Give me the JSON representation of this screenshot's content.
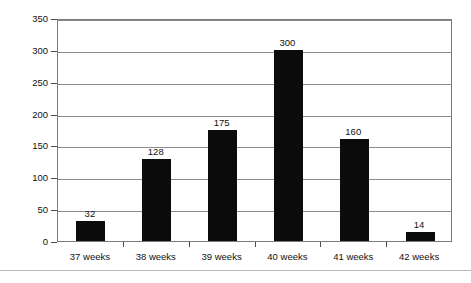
{
  "chart_data": {
    "type": "bar",
    "title": "",
    "subtitle": "",
    "xlabel": "",
    "ylabel": "Number of newborns",
    "categories": [
      "37 weeks",
      "38 weeks",
      "39 weeks",
      "40 weeks",
      "41 weeks",
      "42 weeks"
    ],
    "values": [
      32,
      128,
      175,
      300,
      160,
      14
    ],
    "data_labels": [
      "32",
      "128",
      "175",
      "300",
      "160",
      "14"
    ],
    "ylim": [
      0,
      350
    ],
    "ytick_values": [
      0,
      50,
      100,
      150,
      200,
      250,
      300,
      350
    ],
    "ytick_labels": [
      "0",
      "50",
      "100",
      "150",
      "200",
      "250",
      "300",
      "350"
    ],
    "grid": "horizontal",
    "legend": "none",
    "bar_color": "#0b0b0b",
    "plot_border_color": "#7b7b7b",
    "gridline_color": "#8a8a8a",
    "background_color": "#ffffff"
  }
}
